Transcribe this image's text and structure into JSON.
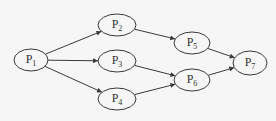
{
  "diagram": {
    "type": "precedence-graph",
    "colors": {
      "background": "#f6f6f6",
      "stroke": "#3a3a3a",
      "text": "#333333"
    },
    "nodes": [
      {
        "id": "P1",
        "base": "P",
        "sub": "1",
        "cx": 31,
        "cy": 60,
        "rx": 17,
        "ry": 11
      },
      {
        "id": "P2",
        "base": "P",
        "sub": "2",
        "cx": 117,
        "cy": 25,
        "rx": 19,
        "ry": 11
      },
      {
        "id": "P3",
        "base": "P",
        "sub": "3",
        "cx": 117,
        "cy": 61,
        "rx": 19,
        "ry": 11
      },
      {
        "id": "P4",
        "base": "P",
        "sub": "4",
        "cx": 117,
        "cy": 99,
        "rx": 19,
        "ry": 11
      },
      {
        "id": "P5",
        "base": "P",
        "sub": "5",
        "cx": 192,
        "cy": 43,
        "rx": 18,
        "ry": 11
      },
      {
        "id": "P6",
        "base": "P",
        "sub": "6",
        "cx": 192,
        "cy": 80,
        "rx": 18,
        "ry": 11
      },
      {
        "id": "P7",
        "base": "P",
        "sub": "7",
        "cx": 250,
        "cy": 63,
        "rx": 17,
        "ry": 12
      }
    ],
    "edges": [
      {
        "from": "P1",
        "to": "P2"
      },
      {
        "from": "P1",
        "to": "P3"
      },
      {
        "from": "P1",
        "to": "P4"
      },
      {
        "from": "P2",
        "to": "P5"
      },
      {
        "from": "P3",
        "to": "P6"
      },
      {
        "from": "P4",
        "to": "P6"
      },
      {
        "from": "P5",
        "to": "P7"
      },
      {
        "from": "P6",
        "to": "P7"
      }
    ]
  }
}
